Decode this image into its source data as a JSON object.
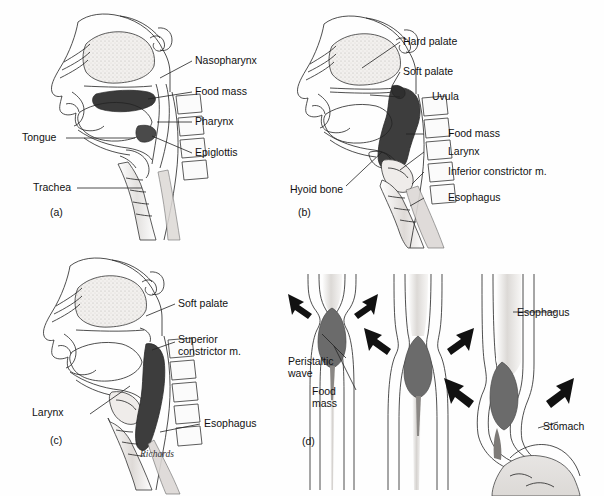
{
  "figure": {
    "signature": "Richards",
    "background_color": "#fefefe",
    "ink_color": "#222222",
    "food_mass_color_dark": "#3a3a3a",
    "food_mass_color_mid": "#6b6b6b",
    "tissue_fill_color": "#e8e8e8",
    "stipple_color": "#bdbdbd"
  },
  "panels": [
    {
      "id": "a",
      "id_label": "(a)",
      "caption_position": "lower-left",
      "labels": [
        {
          "key": "nasopharynx",
          "text": "Nasopharynx",
          "side": "right"
        },
        {
          "key": "food_mass",
          "text": "Food mass",
          "side": "right"
        },
        {
          "key": "pharynx",
          "text": "Pharynx",
          "side": "right"
        },
        {
          "key": "epiglottis",
          "text": "Epiglottis",
          "side": "right"
        },
        {
          "key": "tongue",
          "text": "Tongue",
          "side": "left"
        },
        {
          "key": "trachea",
          "text": "Trachea",
          "side": "left"
        }
      ]
    },
    {
      "id": "b",
      "id_label": "(b)",
      "caption_position": "lower-left",
      "labels": [
        {
          "key": "hard_palate",
          "text": "Hard palate",
          "side": "right"
        },
        {
          "key": "soft_palate",
          "text": "Soft palate",
          "side": "right"
        },
        {
          "key": "uvula",
          "text": "Uvula",
          "side": "right"
        },
        {
          "key": "food_mass",
          "text": "Food mass",
          "side": "right"
        },
        {
          "key": "larynx",
          "text": "Larynx",
          "side": "right"
        },
        {
          "key": "inferior_constrictor",
          "text": "Inferior constrictor m.",
          "side": "right"
        },
        {
          "key": "esophagus",
          "text": "Esophagus",
          "side": "right"
        },
        {
          "key": "hyoid_bone",
          "text": "Hyoid bone",
          "side": "left"
        }
      ]
    },
    {
      "id": "c",
      "id_label": "(c)",
      "caption_position": "lower-left",
      "labels": [
        {
          "key": "soft_palate",
          "text": "Soft palate",
          "side": "right"
        },
        {
          "key": "superior_constrictor_l1",
          "text": "Superior",
          "side": "right"
        },
        {
          "key": "superior_constrictor_l2",
          "text": "constrictor m.",
          "side": "right"
        },
        {
          "key": "esophagus",
          "text": "Esophagus",
          "side": "right"
        },
        {
          "key": "larynx",
          "text": "Larynx",
          "side": "left"
        }
      ]
    },
    {
      "id": "d",
      "id_label": "(d)",
      "caption_position": "lower-left",
      "stages": 3,
      "arrow_count": 6,
      "labels": [
        {
          "key": "esophagus",
          "text": "Esophagus",
          "side": "right"
        },
        {
          "key": "stomach",
          "text": "Stomach",
          "side": "right"
        },
        {
          "key": "peristaltic_wave_l1",
          "text": "Peristaltic",
          "side": "left"
        },
        {
          "key": "peristaltic_wave_l2",
          "text": "wave",
          "side": "left"
        },
        {
          "key": "food_mass_l1",
          "text": "Food",
          "side": "left"
        },
        {
          "key": "food_mass_l2",
          "text": "mass",
          "side": "left"
        }
      ]
    }
  ]
}
